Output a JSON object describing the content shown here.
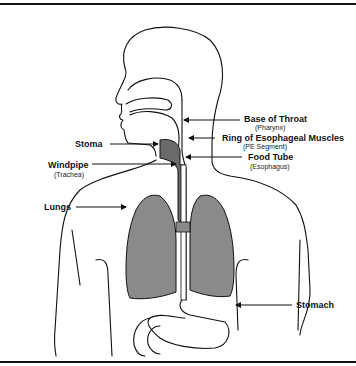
{
  "diagram": {
    "colors": {
      "outline": "#111111",
      "lung_fill": "#8a8a8a",
      "airway_fill": "#6a6a6a",
      "background": "#ffffff"
    },
    "labels": [
      {
        "id": "pharynx",
        "title": "Base of Throat",
        "subtitle": "(Pharynx)"
      },
      {
        "id": "pe-segment",
        "title": "Ring of Esophageal Muscles",
        "subtitle": "(PE Segment)"
      },
      {
        "id": "esophagus",
        "title": "Food Tube",
        "subtitle": "(Esophagus)"
      },
      {
        "id": "stoma",
        "title": "Stoma",
        "subtitle": ""
      },
      {
        "id": "trachea",
        "title": "Windpipe",
        "subtitle": "(Trachea)"
      },
      {
        "id": "lungs",
        "title": "Lungs",
        "subtitle": ""
      },
      {
        "id": "stomach",
        "title": "Stomach",
        "subtitle": ""
      }
    ]
  }
}
